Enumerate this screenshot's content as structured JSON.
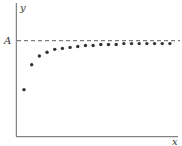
{
  "chart_data": {
    "type": "scatter",
    "title": "",
    "xlabel": "x",
    "ylabel": "y",
    "asymptote": {
      "label": "A",
      "value": 1.0,
      "style": "dashed"
    },
    "x": [
      1,
      2,
      3,
      4,
      5,
      6,
      7,
      8,
      9,
      10,
      11,
      12,
      13,
      14,
      15,
      16,
      17,
      18,
      19,
      20
    ],
    "values": [
      0.49,
      0.75,
      0.84,
      0.88,
      0.91,
      0.92,
      0.93,
      0.94,
      0.95,
      0.95,
      0.96,
      0.96,
      0.96,
      0.97,
      0.97,
      0.97,
      0.97,
      0.97,
      0.97,
      0.97
    ],
    "ylim": [
      0,
      1.3
    ],
    "xlim": [
      0,
      21
    ],
    "grid": false,
    "legend": null,
    "ticks": {
      "x": [],
      "y": [
        "A"
      ]
    }
  },
  "colors": {
    "axis": "#555555",
    "points": "#333333",
    "asymptote": "#333333"
  }
}
